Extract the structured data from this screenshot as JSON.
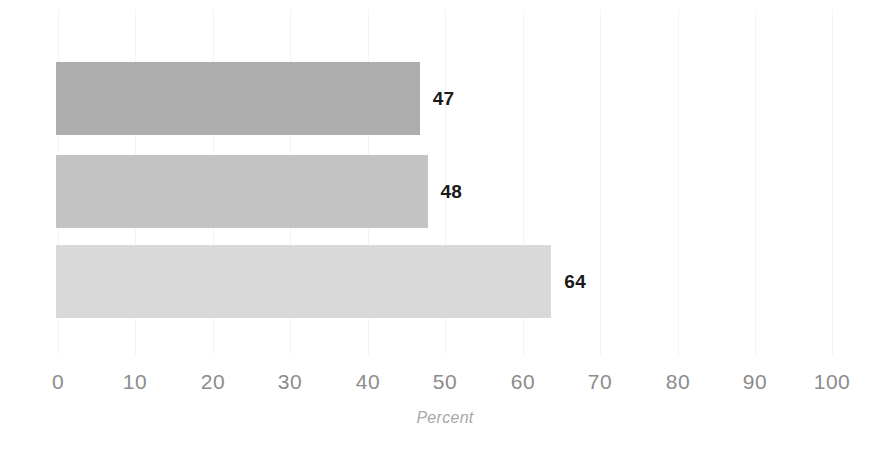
{
  "chart_data": {
    "type": "bar",
    "orientation": "horizontal",
    "title": "",
    "subtitle": "",
    "xlabel": "Percent",
    "ylabel": "",
    "xlim": [
      0,
      100
    ],
    "xticks": [
      0,
      10,
      20,
      30,
      40,
      50,
      60,
      70,
      80,
      90,
      100
    ],
    "xtick_labels": [
      "0",
      "10",
      "20",
      "30",
      "40",
      "50",
      "60",
      "70",
      "80",
      "90",
      "100"
    ],
    "categories": [
      "",
      "",
      ""
    ],
    "values": [
      47,
      48,
      64
    ],
    "data_labels": [
      "47",
      "48",
      "64"
    ],
    "bar_colors": [
      "#adadad",
      "#c3c3c3",
      "#d9d9d9"
    ],
    "grid": "vertical-faint",
    "legend": "none",
    "series": [
      {
        "name": "",
        "values": [
          47,
          48,
          64
        ]
      }
    ]
  },
  "axis": {
    "x_title": "Percent",
    "tick_color": "#8c8c8c",
    "title_color": "#a8a8a8"
  },
  "labels": {
    "color": "#1a1a1a"
  },
  "background": {
    "color": "#ffffff"
  }
}
